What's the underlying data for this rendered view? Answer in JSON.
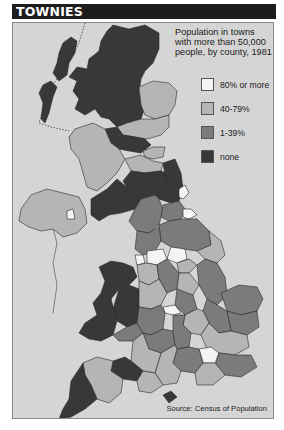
{
  "header": {
    "title": "TOWNIES"
  },
  "subtitle": "Population in towns with more than 50,000 people, by county, 1981",
  "legend": [
    {
      "label": "80% or more",
      "color": "#f4f4f4"
    },
    {
      "label": "40-79%",
      "color": "#b5b5b5"
    },
    {
      "label": "1-39%",
      "color": "#7b7b7b"
    },
    {
      "label": "none",
      "color": "#383838"
    }
  ],
  "source": "Source: Census of Population",
  "colors": {
    "sea": "#d5d5d5",
    "header_bg": "#1d1d1d",
    "border": "#2a2a2a"
  },
  "regions": [
    {
      "name": "Scottish Highlands",
      "category": "none"
    },
    {
      "name": "Grampian",
      "category": "40-79%"
    },
    {
      "name": "Tayside",
      "category": "40-79%"
    },
    {
      "name": "Central",
      "category": "none"
    },
    {
      "name": "Fife",
      "category": "40-79%"
    },
    {
      "name": "Strathclyde",
      "category": "40-79%"
    },
    {
      "name": "Lothian",
      "category": "40-79%"
    },
    {
      "name": "Borders",
      "category": "none"
    },
    {
      "name": "Dumfries and Galloway",
      "category": "none"
    },
    {
      "name": "Northern Ireland",
      "category": "40-79%"
    },
    {
      "name": "Belfast",
      "category": "80% or more"
    },
    {
      "name": "Northumberland",
      "category": "none"
    },
    {
      "name": "Tyne and Wear",
      "category": "80% or more"
    },
    {
      "name": "Cumbria",
      "category": "1-39%"
    },
    {
      "name": "Cleveland",
      "category": "80% or more"
    },
    {
      "name": "North Yorkshire",
      "category": "1-39%"
    },
    {
      "name": "West Yorkshire",
      "category": "80% or more"
    },
    {
      "name": "Greater Manchester",
      "category": "80% or more"
    },
    {
      "name": "Merseyside",
      "category": "80% or more"
    },
    {
      "name": "West Midlands",
      "category": "80% or more"
    },
    {
      "name": "Greater London",
      "category": "80% or more"
    },
    {
      "name": "Gwynedd",
      "category": "none"
    },
    {
      "name": "Powys",
      "category": "none"
    },
    {
      "name": "Cornwall",
      "category": "none"
    },
    {
      "name": "Somerset",
      "category": "none"
    },
    {
      "name": "Devon",
      "category": "40-79%"
    },
    {
      "name": "Norfolk",
      "category": "1-39%"
    },
    {
      "name": "Isle of Wight",
      "category": "none"
    }
  ]
}
